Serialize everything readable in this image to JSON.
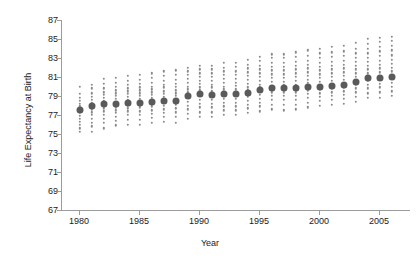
{
  "chart_data": {
    "type": "scatter",
    "title": "",
    "xlabel": "Year",
    "ylabel": "Life Expectancy at Birth",
    "xlim": [
      1978.5,
      2007.5
    ],
    "ylim": [
      67,
      87
    ],
    "grid": false,
    "legend": null,
    "x_ticks": [
      1980,
      1985,
      1990,
      1995,
      2000,
      2005
    ],
    "y_ticks": [
      67,
      69,
      71,
      73,
      75,
      77,
      79,
      81,
      83,
      85,
      87
    ],
    "series": [
      {
        "name": "Mean life expectancy",
        "marker": "large-dark-circle",
        "color": "#5a5a5a",
        "x": [
          1980,
          1981,
          1982,
          1983,
          1984,
          1985,
          1986,
          1987,
          1988,
          1989,
          1990,
          1991,
          1992,
          1993,
          1994,
          1995,
          1996,
          1997,
          1998,
          1999,
          2000,
          2001,
          2002,
          2003,
          2004,
          2005,
          2006
        ],
        "values": [
          77.5,
          77.9,
          78.2,
          78.2,
          78.3,
          78.3,
          78.4,
          78.5,
          78.5,
          79.0,
          79.2,
          79.1,
          79.2,
          79.2,
          79.3,
          79.6,
          79.8,
          79.8,
          79.8,
          79.9,
          80.0,
          80.1,
          80.2,
          80.5,
          80.9,
          80.9,
          81.0
        ]
      },
      {
        "name": "Individual observations",
        "marker": "small-gray-circle",
        "color": "#8a8a8a",
        "columns": [
          {
            "x": 1980,
            "points": [
              75.2,
              75.6,
              76.0,
              76.3,
              76.6,
              76.9,
              77.2,
              77.4,
              77.6,
              77.8,
              78.0,
              78.2,
              78.5,
              78.8,
              79.2,
              80.0
            ]
          },
          {
            "x": 1981,
            "points": [
              75.2,
              75.8,
              76.2,
              76.6,
              77.0,
              77.3,
              77.6,
              77.8,
              78.0,
              78.3,
              78.6,
              78.9,
              79.3,
              79.8,
              80.2
            ]
          },
          {
            "x": 1982,
            "points": [
              75.6,
              76.2,
              76.6,
              77.0,
              77.4,
              77.7,
              78.0,
              78.2,
              78.5,
              78.8,
              79.1,
              79.4,
              79.8,
              80.3,
              80.8
            ]
          },
          {
            "x": 1983,
            "points": [
              75.9,
              76.4,
              76.8,
              77.2,
              77.5,
              77.8,
              78.1,
              78.4,
              78.7,
              79.0,
              79.3,
              79.6,
              80.0,
              80.4,
              80.9
            ]
          },
          {
            "x": 1984,
            "points": [
              76.0,
              76.5,
              77.0,
              77.4,
              77.7,
              78.0,
              78.3,
              78.6,
              78.9,
              79.2,
              79.5,
              79.8,
              80.2,
              80.6,
              81.1
            ]
          },
          {
            "x": 1985,
            "points": [
              76.0,
              76.5,
              77.0,
              77.4,
              77.8,
              78.1,
              78.4,
              78.7,
              79.0,
              79.3,
              79.6,
              79.9,
              80.3,
              80.7,
              81.2
            ]
          },
          {
            "x": 1986,
            "points": [
              76.2,
              76.7,
              77.1,
              77.5,
              77.9,
              78.2,
              78.5,
              78.8,
              79.1,
              79.4,
              79.7,
              80.0,
              80.4,
              80.9,
              81.4
            ]
          },
          {
            "x": 1987,
            "points": [
              76.3,
              76.8,
              77.2,
              77.6,
              78.0,
              78.3,
              78.6,
              78.9,
              79.2,
              79.5,
              79.9,
              80.2,
              80.6,
              81.1,
              81.6
            ]
          },
          {
            "x": 1988,
            "points": [
              76.2,
              76.8,
              77.3,
              77.7,
              78.1,
              78.4,
              78.7,
              79.0,
              79.3,
              79.6,
              80.0,
              80.3,
              80.7,
              81.2,
              81.7
            ]
          },
          {
            "x": 1989,
            "points": [
              76.6,
              77.1,
              77.6,
              78.0,
              78.4,
              78.8,
              79.1,
              79.4,
              79.7,
              80.0,
              80.4,
              80.8,
              81.2,
              81.6,
              82.0
            ]
          },
          {
            "x": 1990,
            "points": [
              76.8,
              77.3,
              77.8,
              78.2,
              78.6,
              79.0,
              79.3,
              79.6,
              79.9,
              80.3,
              80.6,
              81.0,
              81.4,
              81.8,
              82.2
            ]
          },
          {
            "x": 1991,
            "points": [
              76.8,
              77.3,
              77.8,
              78.2,
              78.6,
              78.9,
              79.2,
              79.5,
              79.9,
              80.2,
              80.6,
              81.0,
              81.4,
              81.8,
              82.2
            ]
          },
          {
            "x": 1992,
            "points": [
              77.0,
              77.5,
              77.9,
              78.3,
              78.7,
              79.0,
              79.4,
              79.7,
              80.0,
              80.4,
              80.8,
              81.2,
              81.6,
              82.0,
              82.5
            ]
          },
          {
            "x": 1993,
            "points": [
              77.0,
              77.5,
              77.9,
              78.3,
              78.7,
              79.0,
              79.4,
              79.7,
              80.1,
              80.4,
              80.8,
              81.2,
              81.6,
              82.1,
              82.5
            ]
          },
          {
            "x": 1994,
            "points": [
              77.2,
              77.7,
              78.1,
              78.5,
              78.9,
              79.2,
              79.6,
              79.9,
              80.3,
              80.7,
              81.1,
              81.5,
              81.9,
              82.3,
              82.8
            ]
          },
          {
            "x": 1995,
            "points": [
              77.4,
              77.9,
              78.3,
              78.7,
              79.1,
              79.5,
              79.9,
              80.2,
              80.6,
              81.0,
              81.4,
              81.8,
              82.2,
              82.7,
              83.1
            ]
          },
          {
            "x": 1996,
            "points": [
              77.6,
              78.1,
              78.6,
              79.0,
              79.4,
              79.8,
              80.1,
              80.5,
              80.9,
              81.3,
              81.7,
              82.1,
              82.5,
              83.0,
              83.4
            ]
          },
          {
            "x": 1997,
            "points": [
              77.5,
              78.1,
              78.6,
              79.0,
              79.4,
              79.8,
              80.2,
              80.5,
              80.9,
              81.3,
              81.7,
              82.1,
              82.5,
              83.0,
              83.4
            ]
          },
          {
            "x": 1998,
            "points": [
              77.6,
              78.1,
              78.6,
              79.0,
              79.4,
              79.8,
              80.2,
              80.6,
              81.0,
              81.4,
              81.8,
              82.2,
              82.6,
              83.1,
              83.6
            ]
          },
          {
            "x": 1999,
            "points": [
              77.8,
              78.3,
              78.8,
              79.2,
              79.6,
              80.0,
              80.4,
              80.7,
              81.1,
              81.5,
              81.9,
              82.3,
              82.7,
              83.2,
              83.8
            ]
          },
          {
            "x": 2000,
            "points": [
              78.0,
              78.5,
              78.9,
              79.3,
              79.7,
              80.1,
              80.5,
              80.9,
              81.3,
              81.7,
              82.1,
              82.5,
              83.0,
              83.5,
              84.0
            ]
          },
          {
            "x": 2001,
            "points": [
              78.1,
              78.6,
              79.0,
              79.4,
              79.8,
              80.2,
              80.6,
              81.0,
              81.4,
              81.8,
              82.2,
              82.6,
              83.1,
              83.6,
              84.2
            ]
          },
          {
            "x": 2002,
            "points": [
              78.2,
              78.7,
              79.1,
              79.5,
              79.9,
              80.3,
              80.7,
              81.1,
              81.5,
              81.9,
              82.3,
              82.7,
              83.2,
              83.7,
              84.3
            ]
          },
          {
            "x": 2003,
            "points": [
              78.4,
              78.9,
              79.4,
              79.8,
              80.2,
              80.6,
              81.0,
              81.4,
              81.8,
              82.2,
              82.6,
              83.0,
              83.5,
              84.0,
              84.6
            ]
          },
          {
            "x": 2004,
            "points": [
              78.8,
              79.3,
              79.8,
              80.2,
              80.6,
              81.0,
              81.4,
              81.8,
              82.2,
              82.6,
              83.0,
              83.5,
              84.0,
              84.5,
              85.0
            ]
          },
          {
            "x": 2005,
            "points": [
              78.8,
              79.4,
              79.9,
              80.3,
              80.7,
              81.1,
              81.5,
              81.9,
              82.3,
              82.7,
              83.2,
              83.7,
              84.2,
              84.7,
              85.1
            ]
          },
          {
            "x": 2006,
            "points": [
              79.0,
              79.5,
              80.0,
              80.4,
              80.8,
              81.2,
              81.6,
              82.0,
              82.4,
              82.8,
              83.3,
              83.8,
              84.3,
              84.8,
              85.2
            ]
          }
        ]
      }
    ]
  }
}
